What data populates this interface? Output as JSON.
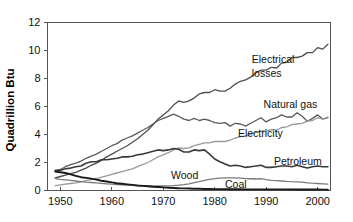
{
  "chart_data": {
    "type": "line",
    "title": "",
    "subtitle": "",
    "xlabel": "",
    "ylabel": "Quadrillion Btu",
    "xlim": [
      1947.5,
      2002.5
    ],
    "ylim": [
      0,
      12
    ],
    "grid": false,
    "legend_position": "inline-annotations",
    "x_ticks": [
      1950,
      1960,
      1970,
      1980,
      1990,
      2000
    ],
    "x_tick_labels": [
      "1950",
      "1960",
      "1970",
      "1980",
      "1990",
      "2000"
    ],
    "y_ticks": [
      0,
      2,
      4,
      6,
      8,
      10,
      12
    ],
    "y_tick_labels": [
      "0",
      "2",
      "4",
      "6",
      "8",
      "10",
      "12"
    ],
    "x": [
      1949,
      1950,
      1951,
      1952,
      1953,
      1954,
      1955,
      1956,
      1957,
      1958,
      1959,
      1960,
      1961,
      1962,
      1963,
      1964,
      1965,
      1966,
      1967,
      1968,
      1969,
      1970,
      1971,
      1972,
      1973,
      1974,
      1975,
      1976,
      1977,
      1978,
      1979,
      1980,
      1981,
      1982,
      1983,
      1984,
      1985,
      1986,
      1987,
      1988,
      1989,
      1990,
      1991,
      1992,
      1993,
      1994,
      1995,
      1996,
      1997,
      1998,
      1999,
      2000,
      2001,
      2002
    ],
    "series": [
      {
        "name": "Electrical losses",
        "color": "#4d4d4d",
        "width": 1.3,
        "label_x": 1989,
        "label_y": 8.85,
        "values": [
          0.9,
          1.0,
          1.1,
          1.2,
          1.3,
          1.45,
          1.6,
          1.8,
          1.95,
          2.15,
          2.4,
          2.6,
          2.8,
          3.0,
          3.2,
          3.45,
          3.7,
          4.0,
          4.3,
          4.7,
          5.1,
          5.4,
          5.7,
          6.1,
          6.4,
          6.3,
          6.4,
          6.6,
          6.9,
          7.0,
          7.0,
          7.2,
          7.1,
          7.1,
          7.3,
          7.6,
          7.8,
          7.9,
          8.1,
          8.4,
          8.6,
          8.6,
          8.8,
          8.75,
          9.1,
          9.15,
          9.5,
          9.5,
          9.6,
          9.85,
          9.85,
          10.2,
          10.1,
          10.45
        ]
      },
      {
        "name": "Natural gas",
        "color": "#5a5a5a",
        "width": 1.3,
        "label_x": 1991,
        "label_y": 6.15,
        "values": [
          1.4,
          1.5,
          1.7,
          1.85,
          1.95,
          2.1,
          2.3,
          2.45,
          2.6,
          2.8,
          3.0,
          3.2,
          3.35,
          3.6,
          3.75,
          3.9,
          4.1,
          4.3,
          4.5,
          4.75,
          5.0,
          5.15,
          5.3,
          5.45,
          5.3,
          5.1,
          5.0,
          5.15,
          5.0,
          5.1,
          5.0,
          4.85,
          4.8,
          4.85,
          4.6,
          4.8,
          4.75,
          4.6,
          4.8,
          5.0,
          5.2,
          4.9,
          5.1,
          5.2,
          5.4,
          5.25,
          5.25,
          5.55,
          5.3,
          4.95,
          5.15,
          5.4,
          5.1,
          5.2
        ]
      },
      {
        "name": "Electricity",
        "color": "#9a9a9a",
        "width": 1.3,
        "label_x": 1986,
        "label_y": 4.1,
        "values": [
          0.35,
          0.4,
          0.45,
          0.5,
          0.55,
          0.62,
          0.7,
          0.78,
          0.85,
          0.95,
          1.05,
          1.15,
          1.25,
          1.35,
          1.45,
          1.55,
          1.7,
          1.85,
          2.0,
          2.2,
          2.4,
          2.55,
          2.7,
          2.9,
          3.05,
          3.0,
          3.05,
          3.2,
          3.3,
          3.4,
          3.4,
          3.5,
          3.5,
          3.5,
          3.6,
          3.75,
          3.85,
          3.9,
          4.0,
          4.15,
          4.25,
          4.25,
          4.35,
          4.3,
          4.5,
          4.55,
          4.7,
          4.75,
          4.8,
          4.95,
          5.0,
          5.2,
          5.1,
          5.25
        ]
      },
      {
        "name": "Petroleum",
        "color": "#3a3a3a",
        "width": 1.6,
        "label_x": 1993,
        "label_y": 2.05,
        "values": [
          1.45,
          1.45,
          1.55,
          1.6,
          1.7,
          1.75,
          1.95,
          2.05,
          2.05,
          2.2,
          2.2,
          2.25,
          2.3,
          2.4,
          2.4,
          2.45,
          2.55,
          2.6,
          2.7,
          2.8,
          2.9,
          2.85,
          2.9,
          3.0,
          2.95,
          2.75,
          2.75,
          2.9,
          2.85,
          2.9,
          2.6,
          2.25,
          2.05,
          1.9,
          1.75,
          1.8,
          1.75,
          1.65,
          1.7,
          1.75,
          1.8,
          1.65,
          1.65,
          1.7,
          1.75,
          1.75,
          1.7,
          1.8,
          1.7,
          1.6,
          1.7,
          1.75,
          1.7,
          1.7
        ]
      },
      {
        "name": "Wood",
        "color": "#7a7a7a",
        "width": 1.3,
        "label_x": 1973,
        "label_y": 1.05,
        "values": [
          0.85,
          0.8,
          0.76,
          0.72,
          0.68,
          0.64,
          0.6,
          0.57,
          0.54,
          0.51,
          0.48,
          0.45,
          0.43,
          0.41,
          0.39,
          0.37,
          0.35,
          0.34,
          0.33,
          0.32,
          0.32,
          0.32,
          0.33,
          0.35,
          0.38,
          0.42,
          0.48,
          0.56,
          0.64,
          0.72,
          0.8,
          0.85,
          0.88,
          0.9,
          0.9,
          0.9,
          0.88,
          0.85,
          0.84,
          0.82,
          0.85,
          0.78,
          0.72,
          0.7,
          0.68,
          0.65,
          0.63,
          0.62,
          0.6,
          0.55,
          0.52,
          0.5,
          0.48,
          0.46
        ]
      },
      {
        "name": "Coal",
        "color": "#1a1a1a",
        "width": 1.9,
        "label_x": 1983,
        "label_y": 0.42,
        "values": [
          1.35,
          1.3,
          1.25,
          1.15,
          1.05,
          0.95,
          0.9,
          0.85,
          0.78,
          0.7,
          0.64,
          0.58,
          0.52,
          0.48,
          0.44,
          0.4,
          0.36,
          0.33,
          0.3,
          0.27,
          0.25,
          0.22,
          0.2,
          0.18,
          0.16,
          0.15,
          0.14,
          0.13,
          0.12,
          0.11,
          0.11,
          0.1,
          0.1,
          0.1,
          0.09,
          0.09,
          0.09,
          0.08,
          0.08,
          0.08,
          0.08,
          0.08,
          0.08,
          0.08,
          0.08,
          0.08,
          0.07,
          0.07,
          0.07,
          0.07,
          0.07,
          0.07,
          0.06,
          0.06
        ]
      }
    ],
    "annotations": [
      {
        "text": "Electrical",
        "x": 1987.2,
        "y": 9.35
      },
      {
        "text": "losses",
        "x": 1987.2,
        "y": 8.35
      },
      {
        "text": "Natural gas",
        "x": 1989.5,
        "y": 6.15
      },
      {
        "text": "Electricity",
        "x": 1984.5,
        "y": 4.1
      },
      {
        "text": "Petroleum",
        "x": 1991.5,
        "y": 2.05
      },
      {
        "text": "Wood",
        "x": 1971.5,
        "y": 1.05
      },
      {
        "text": "Coal",
        "x": 1982.0,
        "y": 0.42
      }
    ]
  }
}
